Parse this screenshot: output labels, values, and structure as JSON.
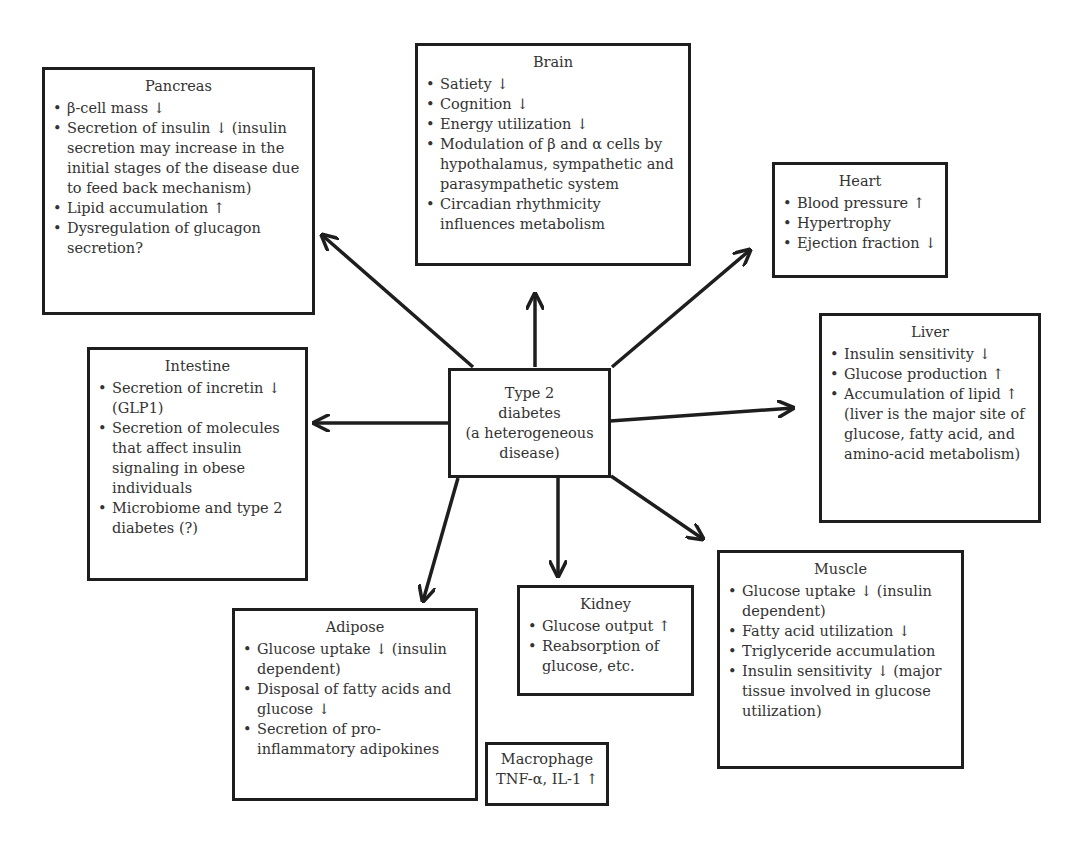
{
  "center": {
    "lines": [
      "Type 2",
      "diabetes",
      "(a heterogeneous",
      "disease)"
    ]
  },
  "organs": {
    "pancreas": {
      "title": "Pancreas",
      "items": [
        "β-cell mass ↓",
        "Secretion of insulin ↓ (insulin secretion may increase in the initial stages of the disease due to feed back mechanism)",
        "Lipid accumulation ↑",
        "Dysregulation of glucagon secretion?"
      ]
    },
    "brain": {
      "title": "Brain",
      "items": [
        "Satiety ↓",
        "Cognition ↓",
        "Energy utilization ↓",
        "Modulation of β and α cells by hypothalamus, sympathetic and parasympathetic system",
        "Circadian rhythmicity influences metabolism"
      ]
    },
    "heart": {
      "title": "Heart",
      "items": [
        "Blood pressure ↑",
        "Hypertrophy",
        "Ejection fraction ↓"
      ]
    },
    "liver": {
      "title": "Liver",
      "items": [
        "Insulin sensitivity ↓",
        "Glucose production ↑",
        "Accumulation of lipid ↑ (liver is the major site of glucose, fatty acid, and amino-acid metabolism)"
      ]
    },
    "intestine": {
      "title": "Intestine",
      "items": [
        "Secretion of incretin ↓ (GLP1)",
        "Secretion of molecules that affect insulin signaling in obese individuals",
        "Microbiome and type 2 diabetes (?)"
      ]
    },
    "adipose": {
      "title": "Adipose",
      "items": [
        "Glucose uptake ↓ (insulin dependent)",
        "Disposal of fatty acids and glucose ↓",
        "Secretion of pro-inflammatory adipokines"
      ]
    },
    "kidney": {
      "title": "Kidney",
      "items": [
        "Glucose output ↑",
        "Reabsorption of glucose, etc."
      ]
    },
    "muscle": {
      "title": "Muscle",
      "items": [
        "Glucose uptake ↓ (insulin dependent)",
        "Fatty acid utilization ↓",
        "Triglyceride accumulation",
        "Insulin sensitivity ↓ (major tissue involved in glucose utilization)"
      ]
    },
    "macrophage": {
      "lines": [
        "Macrophage",
        "TNF-α, IL-1 ↑"
      ]
    }
  },
  "colors": {
    "line": "#1e1e1e",
    "text": "#333333",
    "background": "#ffffff"
  }
}
